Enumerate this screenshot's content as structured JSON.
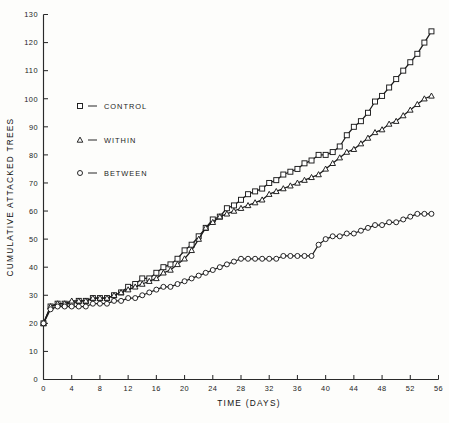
{
  "chart_data": {
    "type": "line",
    "title": "",
    "xlabel": "TIME (DAYS)",
    "ylabel": "CUMULATIVE ATTACKED TREES",
    "xlim": [
      0,
      56
    ],
    "ylim": [
      0,
      130
    ],
    "xticks": [
      0,
      4,
      8,
      12,
      16,
      20,
      24,
      28,
      32,
      36,
      40,
      44,
      48,
      52,
      56
    ],
    "yticks": [
      0,
      10,
      20,
      30,
      40,
      50,
      60,
      70,
      80,
      90,
      100,
      110,
      120,
      130
    ],
    "grid": false,
    "legend_position": "upper-left-inside",
    "series": [
      {
        "name": "CONTROL",
        "marker": "square",
        "x": [
          0,
          1,
          2,
          3,
          4,
          5,
          6,
          7,
          8,
          9,
          10,
          11,
          12,
          13,
          14,
          15,
          16,
          17,
          18,
          19,
          20,
          21,
          22,
          23,
          24,
          25,
          26,
          27,
          28,
          29,
          30,
          31,
          32,
          33,
          34,
          35,
          36,
          37,
          38,
          39,
          40,
          41,
          42,
          43,
          44,
          45,
          46,
          47,
          48,
          49,
          50,
          51,
          52,
          53,
          54,
          55
        ],
        "values": [
          20,
          26,
          27,
          27,
          27,
          28,
          28,
          29,
          29,
          29,
          30,
          31,
          33,
          34,
          36,
          36,
          38,
          40,
          41,
          43,
          46,
          48,
          51,
          54,
          57,
          58,
          61,
          62,
          64,
          66,
          67,
          68,
          70,
          71,
          73,
          74,
          75,
          77,
          78,
          80,
          80,
          81,
          83,
          87,
          90,
          92,
          95,
          99,
          101,
          104,
          107,
          110,
          113,
          116,
          120,
          124
        ]
      },
      {
        "name": "WITHIN",
        "marker": "triangle",
        "x": [
          0,
          1,
          2,
          3,
          4,
          5,
          6,
          7,
          8,
          9,
          10,
          11,
          12,
          13,
          14,
          15,
          16,
          17,
          18,
          19,
          20,
          21,
          22,
          23,
          24,
          25,
          26,
          27,
          28,
          29,
          30,
          31,
          32,
          33,
          34,
          35,
          36,
          37,
          38,
          39,
          40,
          41,
          42,
          43,
          44,
          45,
          46,
          47,
          48,
          49,
          50,
          51,
          52,
          53,
          54,
          55
        ],
        "values": [
          20,
          26,
          27,
          27,
          28,
          28,
          28,
          29,
          29,
          29,
          30,
          31,
          32,
          33,
          34,
          35,
          36,
          38,
          39,
          41,
          43,
          46,
          50,
          54,
          56,
          58,
          59,
          60,
          61,
          62,
          63,
          64,
          66,
          67,
          68,
          69,
          70,
          71,
          72,
          73,
          75,
          77,
          79,
          81,
          82,
          84,
          86,
          88,
          89,
          91,
          92,
          94,
          96,
          98,
          100,
          101
        ]
      },
      {
        "name": "BETWEEN",
        "marker": "circle",
        "x": [
          0,
          1,
          2,
          3,
          4,
          5,
          6,
          7,
          8,
          9,
          10,
          11,
          12,
          13,
          14,
          15,
          16,
          17,
          18,
          19,
          20,
          21,
          22,
          23,
          24,
          25,
          26,
          27,
          28,
          29,
          30,
          31,
          32,
          33,
          34,
          35,
          36,
          37,
          38,
          39,
          40,
          41,
          42,
          43,
          44,
          45,
          46,
          47,
          48,
          49,
          50,
          51,
          52,
          53,
          54,
          55
        ],
        "values": [
          20,
          25,
          26,
          26,
          26,
          26,
          26,
          27,
          27,
          27,
          28,
          28,
          29,
          29,
          30,
          31,
          32,
          33,
          33,
          34,
          35,
          36,
          37,
          38,
          39,
          40,
          41,
          42,
          43,
          43,
          43,
          43,
          43,
          43,
          44,
          44,
          44,
          44,
          44,
          48,
          50,
          51,
          51,
          52,
          52,
          53,
          54,
          55,
          55,
          56,
          56,
          57,
          58,
          59,
          59,
          59
        ]
      }
    ]
  },
  "legend": {
    "dash": "–",
    "entries": [
      {
        "label": "CONTROL",
        "marker": "square"
      },
      {
        "label": "WITHIN",
        "marker": "triangle"
      },
      {
        "label": "BETWEEN",
        "marker": "circle"
      }
    ]
  }
}
